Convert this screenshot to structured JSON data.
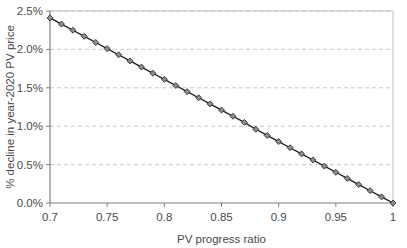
{
  "chart_data": {
    "type": "line",
    "title": "",
    "subtitle": "",
    "xlabel": "PV progress ratio",
    "ylabel": "% decline in year-2020 PV price",
    "xlim": [
      0.7,
      1.0
    ],
    "ylim": [
      0.0,
      2.5
    ],
    "xticks": [
      0.7,
      0.75,
      0.8,
      0.85,
      0.9,
      0.95,
      1.0
    ],
    "xtick_labels": [
      "0.7",
      "0.75",
      "0.8",
      "0.85",
      "0.9",
      "0.95",
      "1"
    ],
    "yticks": [
      0.0,
      0.5,
      1.0,
      1.5,
      2.0,
      2.5
    ],
    "ytick_labels": [
      "0.0%",
      "0.5%",
      "1.0%",
      "1.5%",
      "2.0%",
      "2.5%"
    ],
    "grid": "horizontal-dashed",
    "legend": "none",
    "marker": "diamond",
    "marker_fill": "#8c8c8c",
    "marker_edge": "#222222",
    "line_color": "#1a1a1a",
    "gridline_color": "#c8c8d8",
    "axis_color": "#808080",
    "plot_background": "#ffffff",
    "x": [
      0.7,
      0.71,
      0.72,
      0.73,
      0.74,
      0.75,
      0.76,
      0.77,
      0.78,
      0.79,
      0.8,
      0.81,
      0.82,
      0.83,
      0.84,
      0.85,
      0.86,
      0.87,
      0.88,
      0.89,
      0.9,
      0.91,
      0.92,
      0.93,
      0.94,
      0.95,
      0.96,
      0.97,
      0.98,
      0.99,
      1.0
    ],
    "values": [
      2.41,
      2.33,
      2.25,
      2.17,
      2.09,
      2.01,
      1.93,
      1.85,
      1.77,
      1.69,
      1.61,
      1.53,
      1.45,
      1.37,
      1.29,
      1.21,
      1.13,
      1.05,
      0.96,
      0.88,
      0.8,
      0.72,
      0.64,
      0.56,
      0.48,
      0.4,
      0.32,
      0.24,
      0.16,
      0.08,
      0.0
    ],
    "series": [
      {
        "name": "% decline in year-2020 PV price",
        "values": [
          2.41,
          2.33,
          2.25,
          2.17,
          2.09,
          2.01,
          1.93,
          1.85,
          1.77,
          1.69,
          1.61,
          1.53,
          1.45,
          1.37,
          1.29,
          1.21,
          1.13,
          1.05,
          0.96,
          0.88,
          0.8,
          0.72,
          0.64,
          0.56,
          0.48,
          0.4,
          0.32,
          0.24,
          0.16,
          0.08,
          0.0
        ]
      }
    ]
  }
}
